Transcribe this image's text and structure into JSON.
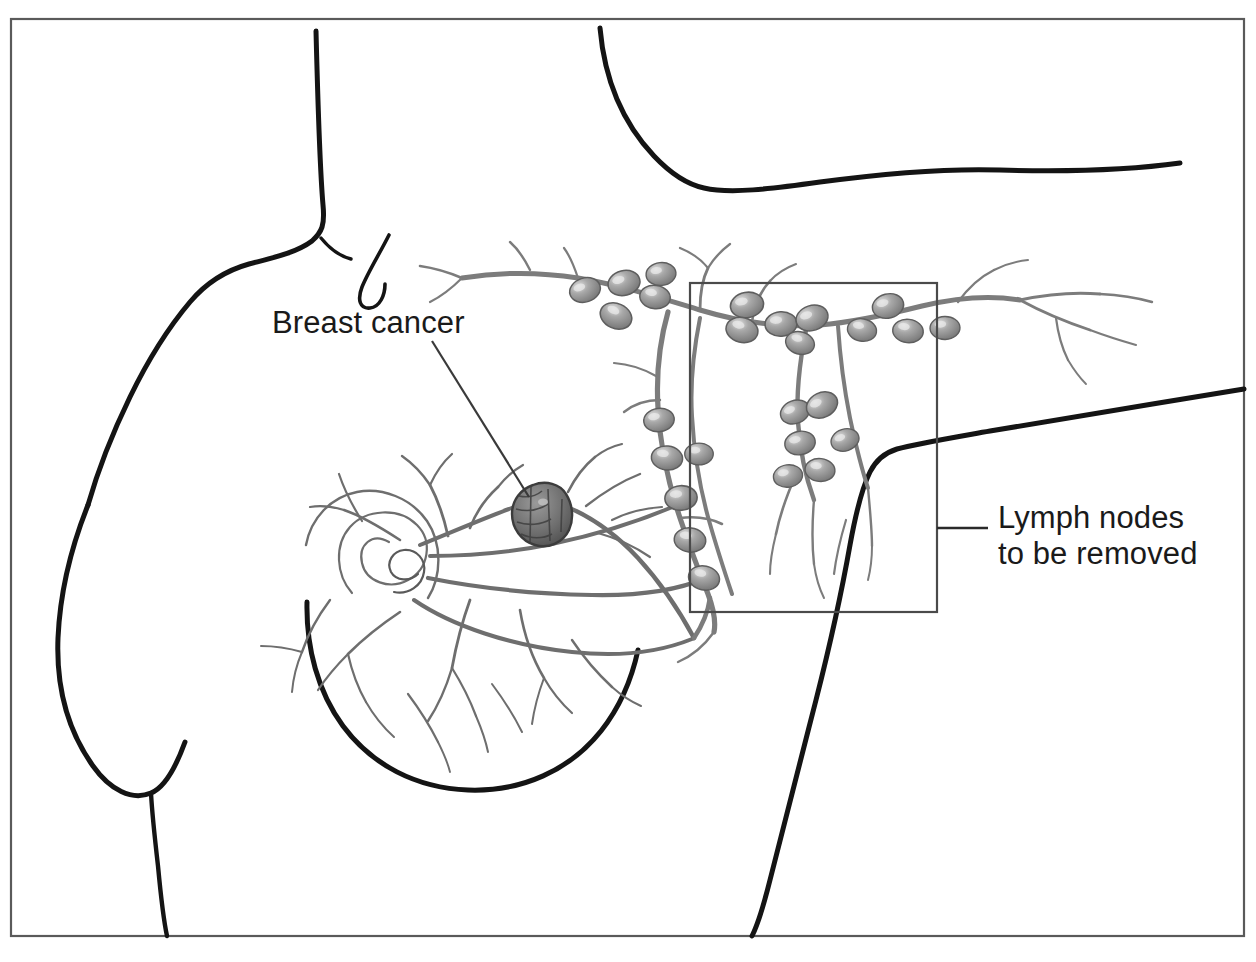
{
  "figure": {
    "kind": "medical-illustration",
    "background_color": "#ffffff",
    "frame": {
      "name": "illustration-border",
      "color": "#5a5a5a",
      "x": 11,
      "y": 19,
      "width": 1233,
      "height": 917
    }
  },
  "labels": {
    "breast_cancer": {
      "text": "Breast cancer",
      "x": 272,
      "y": 333,
      "font_size": 31,
      "color": "#1a1a1a",
      "leader": {
        "x1": 432,
        "y1": 341,
        "x2": 529,
        "y2": 497
      }
    },
    "lymph_nodes": {
      "line1": "Lymph nodes",
      "line2": "to be removed",
      "x": 998,
      "y1": 528,
      "y2": 564,
      "font_size": 31,
      "color": "#1a1a1a",
      "leader": {
        "x1": 937,
        "y1": 528,
        "x2": 986,
        "y2": 528
      }
    }
  },
  "removal_box": {
    "name": "lymph-node-removal-region",
    "x": 690,
    "y": 283,
    "width": 247,
    "height": 329,
    "stroke": "#4a4a4a",
    "stroke_width": 2
  },
  "anatomy": {
    "body_outline_color": "#141414",
    "lymphatic_color": "#7c7c7c",
    "duct_color": "#6e6e6e",
    "node_fill": "#8f8f8f",
    "node_stroke": "#5e5e5e",
    "node_highlight": "#dcdcdc",
    "tumor_fill": "#6a6a6a",
    "tumor_stroke": "#3c3c3c",
    "parts": [
      {
        "name": "neck-and-shoulder-outline",
        "desc": "left neck descending to shoulder"
      },
      {
        "name": "raised-arm-underside",
        "desc": "upper right sweeping arm line"
      },
      {
        "name": "torso-side-outline",
        "desc": "right flank rising to armpit"
      },
      {
        "name": "near-breast-contour",
        "desc": "breast with nipple and ducts"
      },
      {
        "name": "far-breast-contour",
        "desc": "opposite breast at left"
      },
      {
        "name": "axillary-lymph-chain",
        "desc": "chain of lymph nodes in armpit"
      },
      {
        "name": "internal-mammary-chain",
        "desc": "vertical node chain"
      },
      {
        "name": "breast-tumor",
        "desc": "irregular dark mass in upper outer quadrant"
      }
    ]
  },
  "caption": {
    "text": "",
    "visible": false
  }
}
